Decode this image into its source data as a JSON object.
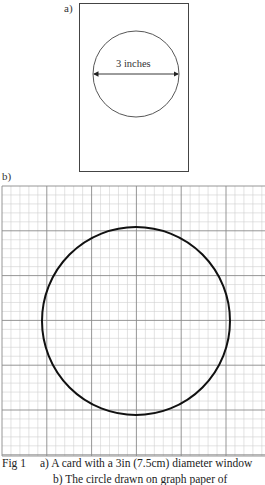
{
  "figure": {
    "panel_a": {
      "label": "a)",
      "card": {
        "x": 79,
        "y": 3,
        "width": 110,
        "height": 169
      },
      "circle": {
        "cx": 136,
        "cy": 74,
        "r": 43
      },
      "dimension_text": "3 inches"
    },
    "panel_b": {
      "label": "b)",
      "grid": {
        "x": 2,
        "y": 186,
        "width": 263,
        "height": 270,
        "major_spacing": 44.8,
        "minor_per_major": 5
      },
      "circle": {
        "cx": 136,
        "cy": 321,
        "r": 94
      }
    },
    "caption": {
      "fig_label": "Fig 1",
      "line1": "a) A card with a 3in (7.5cm) diameter window",
      "line2": "b) The circle drawn on graph paper of"
    },
    "colors": {
      "line": "#333333",
      "grid_major": "#8a8a8a",
      "grid_minor": "#d0d0d0",
      "circle_b": "#111111"
    }
  }
}
